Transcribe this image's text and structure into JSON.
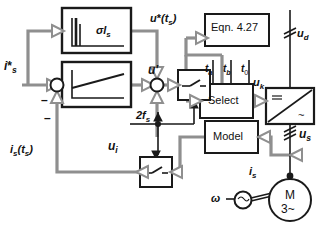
{
  "diagram": {
    "type": "control-block-diagram",
    "stroke_color": "#1a1a1a",
    "signal_gray": "#8a8a8a",
    "background": "#ffffff"
  },
  "blocks": {
    "sigma_gain": {
      "label": "σl",
      "label_sub": "s",
      "kind": "step-response-block"
    },
    "pi_controller": {
      "label": "",
      "kind": "ramp-response-block"
    },
    "equation": {
      "label": "Eqn. 4.27",
      "kind": "computation-block"
    },
    "select": {
      "label": "Select",
      "kind": "selector-block"
    },
    "inverter": {
      "label_dc": "=",
      "label_ac": "~",
      "kind": "inverter-block"
    },
    "model": {
      "label": "Model",
      "kind": "model-block"
    },
    "sampler_upper": {
      "label": "",
      "kind": "switch-block"
    },
    "sampler_lower": {
      "label": "",
      "kind": "switch-block"
    },
    "motor": {
      "label_top": "M",
      "label_bottom": "3~",
      "kind": "machine-symbol"
    },
    "tacho": {
      "label": "",
      "kind": "tachometer-symbol"
    }
  },
  "signals": {
    "i_s_ref": {
      "text": "i",
      "sub": "s",
      "star": "*"
    },
    "i_s_sampled": {
      "text": "i",
      "sub": "s",
      "arg": "(t",
      "arg_sub": "s",
      "arg_end": ")"
    },
    "u_prime": {
      "text": "u",
      "prime": "'"
    },
    "u_i": {
      "text": "u",
      "sub": "i"
    },
    "u_star_ts": {
      "text": "u",
      "star": "*",
      "arg": "(t",
      "arg_sub": "s",
      "arg_end": ")"
    },
    "u_k": {
      "text": "u",
      "sub": "k"
    },
    "u_d": {
      "text": "u",
      "sub": "d"
    },
    "u_s": {
      "text": "u",
      "sub": "s"
    },
    "i_s": {
      "text": "i",
      "sub": "s"
    },
    "two_fs": {
      "text": "2f",
      "sub": "s"
    },
    "omega": {
      "text": "ω"
    },
    "t_a": {
      "text": "t",
      "sub": "a"
    },
    "t_b": {
      "text": "t",
      "sub": "b"
    },
    "t_0": {
      "text": "t",
      "sub": "0"
    },
    "minus_top": "–",
    "minus_bottom": "–"
  }
}
